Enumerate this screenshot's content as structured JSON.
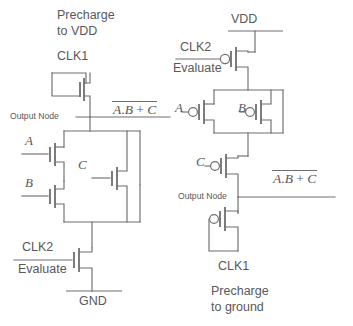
{
  "figure": {
    "line_color": "#6e6e70",
    "text_color": "#58585a",
    "background": "#ffffff"
  },
  "left_circuit": {
    "name": "precharge-to-vdd-dynamic-gate",
    "note_line1": "Precharge",
    "note_line2": "to VDD",
    "precharge_clock": "CLK1",
    "output_node_label": "Output Node",
    "output_expression": {
      "overbar": false,
      "text": "A.B + C",
      "parts": {
        "a": "A",
        "dot": ".",
        "b": "B",
        "plus": "+",
        "c": "C"
      }
    },
    "pulldown_inputs": {
      "a": "A",
      "b": "B",
      "c": "C"
    },
    "evaluate_clock": "CLK2",
    "evaluate_label": "Evaluate",
    "ground_label": "GND",
    "transistors": [
      {
        "name": "pmos-precharge-clk1",
        "type": "pmos",
        "gate": "CLK1"
      },
      {
        "name": "nmos-input-a",
        "type": "nmos",
        "gate": "A"
      },
      {
        "name": "nmos-input-b",
        "type": "nmos",
        "gate": "B"
      },
      {
        "name": "nmos-input-c",
        "type": "nmos",
        "gate": "C"
      },
      {
        "name": "nmos-evaluate-clk2",
        "type": "nmos",
        "gate": "CLK2"
      }
    ]
  },
  "right_circuit": {
    "name": "precharge-to-ground-dynamic-gate",
    "supply_label": "VDD",
    "evaluate_clock": "CLK2",
    "evaluate_label": "Evaluate",
    "pullup_inputs": {
      "a": "A",
      "b": "B",
      "c": "C"
    },
    "output_node_label": "Output Node",
    "output_expression": {
      "overbar": true,
      "text": "A.B + C",
      "parts": {
        "a": "A",
        "dot": ".",
        "b": "B",
        "plus": "+",
        "c": "C"
      }
    },
    "precharge_clock": "CLK1",
    "note_line1": "Precharge",
    "note_line2": "to ground",
    "transistors": [
      {
        "name": "pmos-evaluate-clk2",
        "type": "pmos",
        "gate": "CLK2"
      },
      {
        "name": "pmos-input-a",
        "type": "pmos",
        "gate": "A"
      },
      {
        "name": "pmos-input-b",
        "type": "pmos",
        "gate": "B"
      },
      {
        "name": "pmos-input-c",
        "type": "pmos",
        "gate": "C"
      },
      {
        "name": "pmos-precharge-clk1",
        "type": "pmos",
        "gate": "CLK1"
      }
    ]
  }
}
